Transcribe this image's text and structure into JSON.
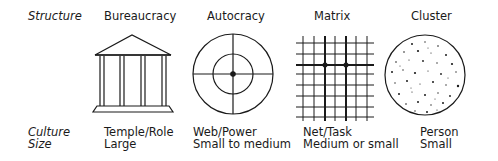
{
  "row_labels": {
    "structure": "Structure",
    "culture": "Culture",
    "size": "Size"
  },
  "columns": [
    {
      "structure": "Bureaucracy",
      "culture": "Temple/Role",
      "size": "Large",
      "icon": "temple-icon"
    },
    {
      "structure": "Autocracy",
      "culture": "Web/Power",
      "size": "Small to medium",
      "icon": "web-icon"
    },
    {
      "structure": "Matrix",
      "culture": "Net/Task",
      "size": "Medium or small",
      "icon": "net-icon"
    },
    {
      "structure": "Cluster",
      "culture": "Person",
      "size": "Small",
      "icon": "cluster-icon"
    }
  ],
  "colors": {
    "ink": "#1a1a1a",
    "background": "#ffffff"
  }
}
